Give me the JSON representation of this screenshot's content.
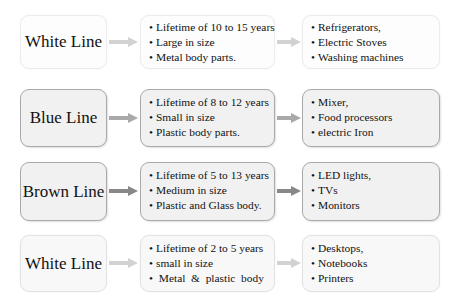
{
  "colors": {
    "arrow_light": "#d2d2d2",
    "arrow_mid": "#a9a9a9",
    "arrow_dark": "#888888",
    "box_light_border": "#ececec",
    "box_dark_border": "#a9a9a9",
    "box_dark_fill": "#f1f1f1"
  },
  "rows": [
    {
      "category": "White Line",
      "properties": [
        "Lifetime of 10 to 15 years",
        "Large in size",
        "Metal body parts."
      ],
      "examples": [
        "Refrigerators,",
        "Electric Stoves",
        "Washing machines"
      ]
    },
    {
      "category": "Blue Line",
      "properties": [
        "Lifetime of 8 to 12 years",
        "Small in size",
        "Plastic body parts."
      ],
      "examples": [
        "Mixer,",
        "Food processors",
        "electric Iron"
      ]
    },
    {
      "category": "Brown Line",
      "properties": [
        "Lifetime of 5 to 13 years",
        "Medium in size",
        "Plastic and Glass body."
      ],
      "examples": [
        "LED lights,",
        "TVs",
        "Monitors"
      ]
    },
    {
      "category": "White Line",
      "properties": [
        "Lifetime of 2 to 5 years",
        "small in size",
        " Metal  &  plastic  body"
      ],
      "examples": [
        "Desktops,",
        "Notebooks",
        "Printers"
      ]
    }
  ],
  "bullet": "•"
}
